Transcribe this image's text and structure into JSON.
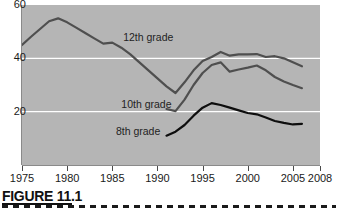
{
  "figure": {
    "caption": "FIGURE 11.1"
  },
  "chart_data": {
    "type": "line",
    "title": "",
    "xlabel": "",
    "ylabel": "",
    "xlim": [
      1975,
      2008
    ],
    "ylim": [
      0,
      60
    ],
    "grid": true,
    "gridlines_y": [
      20,
      40
    ],
    "legend_position": "inline-labels",
    "y_ticks": [
      20,
      40,
      60
    ],
    "y_tick_labels": [
      "20",
      "40",
      "60"
    ],
    "x_ticks": [
      1975,
      1980,
      1985,
      1990,
      1995,
      2000,
      2005,
      2008
    ],
    "x_tick_labels": [
      "1975",
      "1980",
      "1985",
      "1990",
      "1995",
      "2000",
      "2005",
      "2008"
    ],
    "plot_background_color": "#b5b5b5",
    "gridline_color": "#ffffff",
    "series": [
      {
        "name": "12th grade",
        "color": "#4f4f4f",
        "label_x": 1986.2,
        "label_y": 47.5,
        "x": [
          1975,
          1976,
          1977,
          1978,
          1979,
          1980,
          1981,
          1982,
          1983,
          1984,
          1985,
          1986,
          1987,
          1988,
          1989,
          1990,
          1991,
          1992,
          1993,
          1994,
          1995,
          1996,
          1997,
          1998,
          1999,
          2000,
          2001,
          2002,
          2003,
          2004,
          2005,
          2006
        ],
        "values": [
          45.0,
          48.1,
          51.0,
          53.9,
          55.0,
          53.5,
          51.5,
          49.5,
          47.5,
          45.5,
          45.9,
          44.0,
          41.5,
          38.5,
          35.5,
          32.5,
          29.5,
          27.0,
          31.0,
          35.5,
          39.0,
          40.5,
          42.4,
          41.0,
          41.5,
          41.5,
          41.6,
          40.5,
          40.8,
          40.0,
          38.5,
          37.0
        ]
      },
      {
        "name": "10th grade",
        "color": "#4f4f4f",
        "label_x": 1986.0,
        "label_y": 22.5,
        "x": [
          1991,
          1992,
          1993,
          1994,
          1995,
          1996,
          1997,
          1998,
          1999,
          2000,
          2001,
          2002,
          2003,
          2004,
          2005,
          2006
        ],
        "values": [
          21.0,
          20.2,
          24.5,
          30.0,
          34.5,
          37.5,
          38.5,
          35.0,
          35.8,
          36.5,
          37.3,
          35.5,
          33.0,
          31.3,
          30.0,
          28.8
        ]
      },
      {
        "name": "8th grade",
        "color": "#0e0e0e",
        "label_x": 1985.4,
        "label_y": 12.5,
        "x": [
          1991,
          1992,
          1993,
          1994,
          1995,
          1996,
          1997,
          1998,
          1999,
          2000,
          2001,
          2002,
          2003,
          2004,
          2005,
          2006
        ],
        "values": [
          11.0,
          12.5,
          15.0,
          18.5,
          21.5,
          23.2,
          22.5,
          21.5,
          20.5,
          19.5,
          19.0,
          17.8,
          16.5,
          15.8,
          15.2,
          15.4
        ]
      }
    ]
  }
}
